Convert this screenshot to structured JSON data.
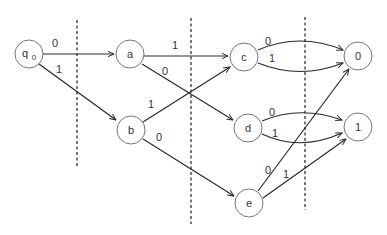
{
  "diagram": {
    "type": "decision-tree-state-diagram",
    "nodes": [
      {
        "id": "q0",
        "label": "q",
        "subscript": "0",
        "x": 29,
        "y": 54
      },
      {
        "id": "a",
        "label": "a",
        "x": 130,
        "y": 54
      },
      {
        "id": "b",
        "label": "b",
        "x": 131,
        "y": 130
      },
      {
        "id": "c",
        "label": "c",
        "x": 244,
        "y": 57
      },
      {
        "id": "d",
        "label": "d",
        "x": 248,
        "y": 128
      },
      {
        "id": "e",
        "label": "e",
        "x": 249,
        "y": 203
      },
      {
        "id": "out0",
        "label": "0",
        "x": 358,
        "y": 56
      },
      {
        "id": "out1",
        "label": "1",
        "x": 358,
        "y": 127
      }
    ],
    "edges": [
      {
        "from": "q0",
        "to": "a",
        "label": "0"
      },
      {
        "from": "q0",
        "to": "b",
        "label": "1"
      },
      {
        "from": "a",
        "to": "c",
        "label": "1"
      },
      {
        "from": "a",
        "to": "d",
        "label": "0"
      },
      {
        "from": "b",
        "to": "c",
        "label": "1"
      },
      {
        "from": "b",
        "to": "e",
        "label": "0"
      },
      {
        "from": "c",
        "to": "out0",
        "label": "0"
      },
      {
        "from": "c",
        "to": "out0",
        "label": "1"
      },
      {
        "from": "d",
        "to": "out1",
        "label": "0"
      },
      {
        "from": "d",
        "to": "out1",
        "label": "1"
      },
      {
        "from": "e",
        "to": "out0",
        "label": "0"
      },
      {
        "from": "e",
        "to": "out1",
        "label": "1"
      }
    ],
    "dividers": [
      {
        "x": 77,
        "y1": 20,
        "y2": 166
      },
      {
        "x": 191,
        "y1": 18,
        "y2": 224
      },
      {
        "x": 305,
        "y1": 17,
        "y2": 210
      }
    ]
  }
}
